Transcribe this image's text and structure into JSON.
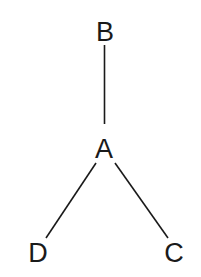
{
  "diagram": {
    "type": "tree",
    "nodes": [
      {
        "id": "B",
        "label": "B"
      },
      {
        "id": "A",
        "label": "A"
      },
      {
        "id": "D",
        "label": "D"
      },
      {
        "id": "C",
        "label": "C"
      }
    ],
    "edges": [
      {
        "from": "B",
        "to": "A"
      },
      {
        "from": "A",
        "to": "D"
      },
      {
        "from": "A",
        "to": "C"
      }
    ]
  }
}
